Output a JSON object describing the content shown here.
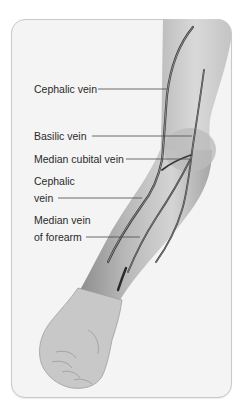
{
  "diagram": {
    "colors": {
      "background": "#ffffff",
      "frame_fill": "#f4f4f4",
      "frame_border": "#c9c9c9",
      "skin_light": "#d8d8d8",
      "skin_dark": "#9a9a9a",
      "vein": "#3a3a3a",
      "leader_line": "#4a4a4a",
      "label_text": "#2a2a2a"
    },
    "labels": [
      {
        "id": "cephalic-vein-upper",
        "lines": [
          "Cephalic vein"
        ],
        "x": 34,
        "y": 81,
        "leader": {
          "x1": 98,
          "y1": 89,
          "x2": 167,
          "y2": 89
        }
      },
      {
        "id": "basilic-vein",
        "lines": [
          "Basilic vein"
        ],
        "x": 34,
        "y": 128,
        "leader": {
          "x1": 92,
          "y1": 136,
          "x2": 192,
          "y2": 136
        }
      },
      {
        "id": "median-cubital-vein",
        "lines": [
          "Median cubital vein"
        ],
        "x": 34,
        "y": 151,
        "leader": {
          "x1": 126,
          "y1": 159,
          "x2": 190,
          "y2": 159
        }
      },
      {
        "id": "cephalic-vein-lower",
        "lines": [
          "Cephalic",
          "vein"
        ],
        "x": 34,
        "y": 173,
        "leader": {
          "x1": 58,
          "y1": 198,
          "x2": 142,
          "y2": 198
        }
      },
      {
        "id": "median-vein-of-forearm",
        "lines": [
          "Median vein",
          "of forearm"
        ],
        "x": 34,
        "y": 212,
        "leader": {
          "x1": 86,
          "y1": 237,
          "x2": 140,
          "y2": 237
        }
      }
    ]
  }
}
